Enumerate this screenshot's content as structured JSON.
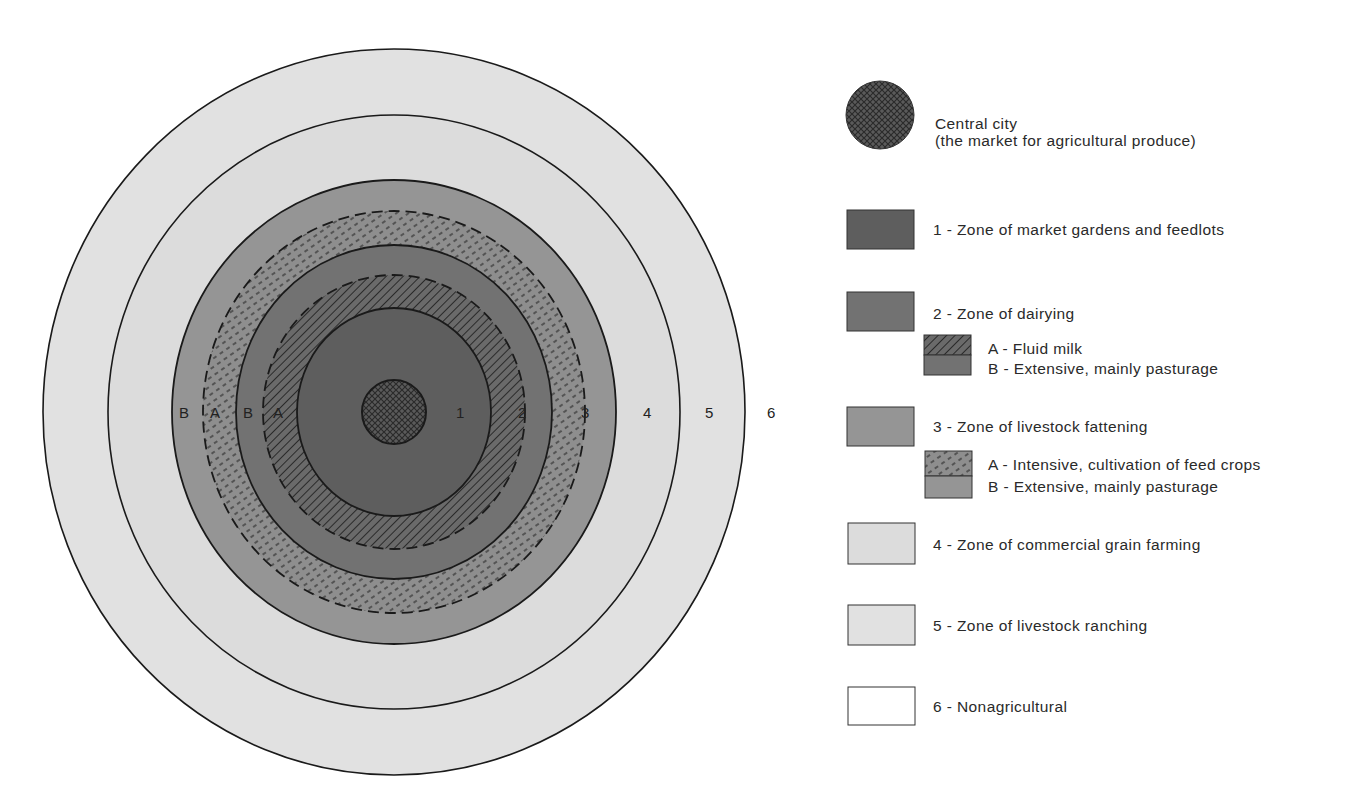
{
  "colors": {
    "zone1": "#5c5c5c",
    "zone2": "#707070",
    "zone3": "#949494",
    "zone4": "#d9d9d9",
    "zone5": "#e0e0e0",
    "zone6": "#ffffff",
    "city": "#555555",
    "outline": "#1a1a1a"
  },
  "diagram": {
    "center": {
      "x": 394,
      "y": 412
    },
    "ring_labels_right": [
      "1",
      "2",
      "3",
      "4",
      "5",
      "6"
    ],
    "ring_labels_left": [
      "B",
      "A",
      "B",
      "A"
    ],
    "rings": [
      {
        "id": "zone5-outer",
        "rx": 351,
        "ry": 363,
        "fill": "zone5",
        "stroke": "solid"
      },
      {
        "id": "zone4-outer",
        "rx": 286,
        "ry": 297,
        "fill": "zone4",
        "stroke": "solid"
      },
      {
        "id": "zone3B-outer",
        "rx": 222,
        "ry": 232,
        "fill": "zone3",
        "stroke": "solid"
      },
      {
        "id": "zone3A-outer",
        "rx": 191,
        "ry": 201,
        "fill": "zone3-hatch",
        "stroke": "dashed"
      },
      {
        "id": "zone2B-outer",
        "rx": 158,
        "ry": 167,
        "fill": "zone2",
        "stroke": "solid"
      },
      {
        "id": "zone2A-outer",
        "rx": 131,
        "ry": 137,
        "fill": "zone2-hatch",
        "stroke": "dashed"
      },
      {
        "id": "zone1-outer",
        "rx": 97,
        "ry": 104,
        "fill": "zone1",
        "stroke": "solid"
      },
      {
        "id": "central-city",
        "rx": 32,
        "ry": 32,
        "fill": "city",
        "stroke": "solid"
      }
    ]
  },
  "legend": {
    "city": {
      "line1": "Central city",
      "line2": "(the market for agricultural produce)"
    },
    "zone1": {
      "label": "1 - Zone of market gardens and feedlots"
    },
    "zone2": {
      "label": "2 - Zone of dairying",
      "sub_a": "A - Fluid milk",
      "sub_b": "B - Extensive, mainly pasturage"
    },
    "zone3": {
      "label": "3 - Zone of livestock fattening",
      "sub_a": "A -  Intensive, cultivation of feed crops",
      "sub_b": "B - Extensive, mainly pasturage"
    },
    "zone4": {
      "label": "4 - Zone of commercial grain farming"
    },
    "zone5": {
      "label": "5 - Zone of livestock ranching"
    },
    "zone6": {
      "label": "6 - Nonagricultural"
    }
  }
}
